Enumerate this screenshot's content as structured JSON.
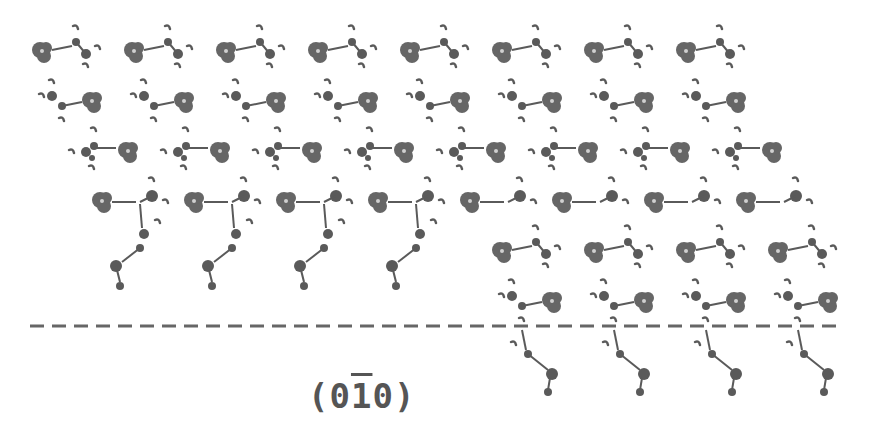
{
  "figure": {
    "type": "crystal-packing-diagram",
    "plane_label": {
      "open": "(",
      "h": "0",
      "k": "1",
      "k_bar": true,
      "l": "0",
      "close": ")"
    },
    "colors": {
      "molecule": "#5a5a5a",
      "cluster": "#666666",
      "dashed_line": "#666666",
      "label": "#555555",
      "background": "#ffffff"
    },
    "rows": [
      {
        "name": "row-1",
        "type": "A",
        "y": 50,
        "x0": 40,
        "count": 8,
        "dx": 92
      },
      {
        "name": "row-2",
        "type": "B",
        "y": 100,
        "x0": 40,
        "count": 8,
        "dx": 92
      },
      {
        "name": "row-3",
        "type": "C",
        "y": 152,
        "x0": 80,
        "count": 8,
        "dx": 92
      },
      {
        "name": "row-4",
        "type": "D",
        "y": 200,
        "x0": 100,
        "count": 4,
        "dx": 92,
        "tail": true
      },
      {
        "name": "row-4b",
        "type": "D",
        "y": 200,
        "x0": 468,
        "count": 4,
        "dx": 92,
        "tail": false
      },
      {
        "name": "row-5",
        "type": "A",
        "y": 250,
        "x0": 500,
        "count": 4,
        "dx": 92
      },
      {
        "name": "row-6",
        "type": "B",
        "y": 300,
        "x0": 500,
        "count": 4,
        "dx": 92,
        "tail": true
      }
    ],
    "dashed_line": {
      "x1": 30,
      "x2": 840,
      "y": 326
    }
  }
}
